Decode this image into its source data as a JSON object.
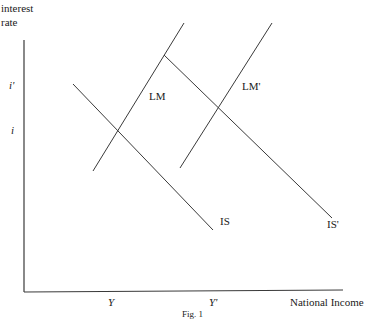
{
  "diagram": {
    "type": "IS-LM shift diagram",
    "y_axis_label_line1": "interest",
    "y_axis_label_line2": "rate",
    "x_axis_label": "National Income",
    "y_ticks": [
      {
        "label": "i'",
        "y": 85
      },
      {
        "label": "i",
        "y": 131
      }
    ],
    "x_ticks": [
      {
        "label": "Y",
        "x": 112
      },
      {
        "label": "Y'",
        "x": 216
      }
    ],
    "curves": [
      {
        "name": "IS",
        "label": "IS",
        "x1": 73,
        "y1": 84,
        "x2": 213,
        "y2": 230
      },
      {
        "name": "LM",
        "label": "LM",
        "x1": 93,
        "y1": 171,
        "x2": 184,
        "y2": 23
      },
      {
        "name": "IS-prime",
        "label": "IS'",
        "x1": 164,
        "y1": 55,
        "x2": 332,
        "y2": 218
      },
      {
        "name": "LM-prime",
        "label": "LM'",
        "x1": 180,
        "y1": 168,
        "x2": 272,
        "y2": 23
      }
    ],
    "caption": "Fig. 1",
    "colors": {
      "line": "#3a3a3a",
      "text": "#1a1a1a",
      "background": "#ffffff"
    }
  }
}
